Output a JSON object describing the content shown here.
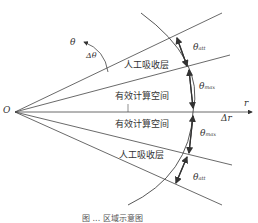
{
  "diagram": {
    "origin_label": "O",
    "axis_label": "r",
    "delta_r_label": "Δr",
    "theta_label": "θ",
    "delta_theta_label": "Δθ",
    "regions": {
      "absorb_upper": "人工吸收层",
      "compute_upper": "有效计算空间",
      "compute_lower": "有效计算空间",
      "absorb_lower": "人工吸收层"
    },
    "angles": {
      "att_upper": {
        "main": "θ",
        "sub": "att"
      },
      "max_upper": {
        "main": "θ",
        "sub": "max"
      },
      "max_lower": {
        "main": "θ",
        "sub": "max"
      },
      "att_lower": {
        "main": "θ",
        "sub": "att"
      }
    },
    "caption": "图 ... 区域示意图",
    "colors": {
      "line": "#444444",
      "text": "#333333"
    }
  }
}
